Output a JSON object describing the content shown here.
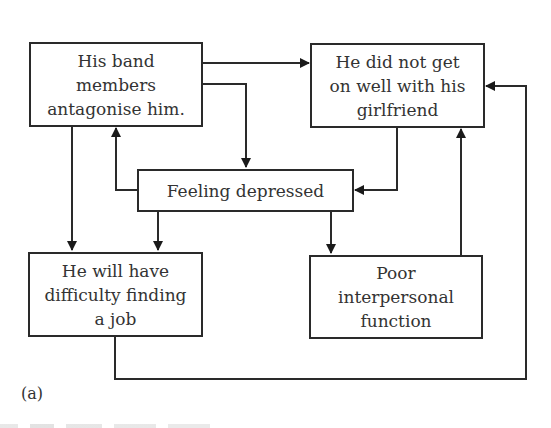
{
  "diagram": {
    "panel_label": "(a)",
    "nodes": {
      "band": {
        "lines": [
          "His band",
          "members",
          "antagonise him."
        ]
      },
      "girlfriend": {
        "lines": [
          "He did not get",
          "on well with his",
          "girlfriend"
        ]
      },
      "depressed": {
        "lines": [
          "Feeling depressed"
        ]
      },
      "job": {
        "lines": [
          "He will have",
          "difficulty finding",
          "a job"
        ]
      },
      "interpersonal": {
        "lines": [
          "Poor",
          "interpersonal",
          "function"
        ]
      }
    },
    "edges": [
      {
        "from": "band",
        "to": "girlfriend"
      },
      {
        "from": "band",
        "to": "depressed"
      },
      {
        "from": "band",
        "to": "job"
      },
      {
        "from": "depressed",
        "to": "band"
      },
      {
        "from": "depressed",
        "to": "job"
      },
      {
        "from": "depressed",
        "to": "interpersonal"
      },
      {
        "from": "girlfriend",
        "to": "depressed"
      },
      {
        "from": "interpersonal",
        "to": "girlfriend"
      },
      {
        "from": "job",
        "to": "girlfriend"
      }
    ],
    "colors": {
      "stroke": "#2a2a2a",
      "text": "#333333",
      "background": "#ffffff"
    }
  }
}
